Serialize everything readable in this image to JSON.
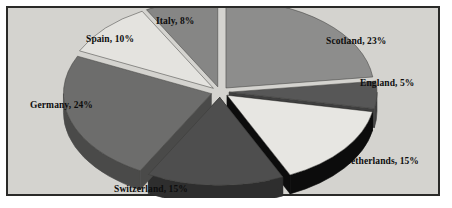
{
  "figure": {
    "background_color": "#d4d3cf",
    "border_color": "#2a2a28",
    "page_color": "#ffffff"
  },
  "chart_data": {
    "type": "pie",
    "title": "",
    "style": "3d-exploded",
    "legend": "none",
    "labels_inline": true,
    "label_format": "{name}, {value}%",
    "total": 100,
    "unit": "%",
    "categories": [
      "Scotland",
      "England",
      "Netherlands",
      "Switzerland",
      "Germany",
      "Spain",
      "Italy"
    ],
    "values": [
      23,
      5,
      15,
      15,
      24,
      10,
      8
    ],
    "slices": [
      {
        "name": "Scotland",
        "value": 23,
        "label": "Scotland, 23%",
        "color": "#8d8d8c",
        "side_color": "#6a6a69",
        "start_deg": 0,
        "end_deg": 82.8
      },
      {
        "name": "England",
        "value": 5,
        "label": "England, 5%",
        "color": "#575757",
        "side_color": "#3f3f3f",
        "start_deg": 82.8,
        "end_deg": 100.8
      },
      {
        "name": "Netherlands",
        "value": 15,
        "label": "Netherlands, 15%",
        "color": "#e7e6e2",
        "side_color": "#0c0c0c",
        "start_deg": 100.8,
        "end_deg": 154.8
      },
      {
        "name": "Switzerland",
        "value": 15,
        "label": "Switzerland, 15%",
        "color": "#4e4e4e",
        "side_color": "#2e2e2e",
        "start_deg": 154.8,
        "end_deg": 208.8
      },
      {
        "name": "Germany",
        "value": 24,
        "label": "Germany, 24%",
        "color": "#6d6d6c",
        "side_color": "#4a4a49",
        "start_deg": 208.8,
        "end_deg": 295.2
      },
      {
        "name": "Spain",
        "value": 10,
        "label": "Spain, 10%",
        "color": "#e4e3df",
        "side_color": "#b4b3b0",
        "start_deg": 295.2,
        "end_deg": 331.2
      },
      {
        "name": "Italy",
        "value": 8,
        "label": "Italy, 8%",
        "color": "#868685",
        "side_color": "#646463",
        "start_deg": 331.2,
        "end_deg": 360
      }
    ]
  }
}
